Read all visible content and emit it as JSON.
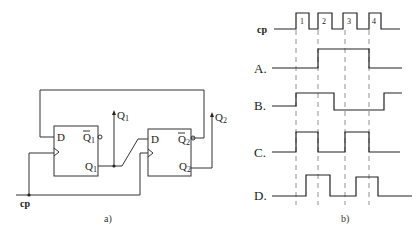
{
  "figure_a": {
    "caption": "a)",
    "clock_label": "cp",
    "flipflop1": {
      "d_label": "D",
      "q_label": "Q",
      "q_sub": "1",
      "qbar_label": "Q",
      "qbar_sub": "1"
    },
    "flipflop2": {
      "d_label": "D",
      "q_label": "Q",
      "q_sub": "2",
      "qbar_label": "Q",
      "qbar_sub": "2"
    },
    "output1": {
      "label": "Q",
      "sub": "1"
    },
    "output2": {
      "label": "Q",
      "sub": "2"
    }
  },
  "figure_b": {
    "caption": "b)",
    "clock_label": "cp",
    "pulse_labels": [
      "1",
      "2",
      "3",
      "4"
    ],
    "options": [
      {
        "label": "A."
      },
      {
        "label": "B."
      },
      {
        "label": "C."
      },
      {
        "label": "D."
      }
    ]
  }
}
